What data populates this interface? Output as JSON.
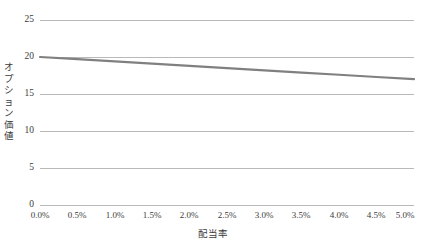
{
  "chart_data": {
    "type": "line",
    "title": "",
    "xlabel": "配当率",
    "ylabel": "オプション価値",
    "xlim": [
      0,
      5
    ],
    "ylim": [
      0,
      25
    ],
    "grid": true,
    "legend": "none",
    "x_tick_labels": [
      "0.0%",
      "0.5%",
      "1.0%",
      "1.5%",
      "2.0%",
      "2.5%",
      "3.0%",
      "3.5%",
      "4.0%",
      "4.5%",
      "5.0%"
    ],
    "y_tick_labels": [
      "0",
      "5",
      "10",
      "15",
      "20",
      "25"
    ],
    "x": [
      0,
      0.5,
      1.0,
      1.5,
      2.0,
      2.5,
      3.0,
      3.5,
      4.0,
      4.5,
      5.0
    ],
    "series": [
      {
        "name": "オプション価値",
        "color": "#808080",
        "values": [
          20.0,
          19.7,
          19.4,
          19.1,
          18.8,
          18.5,
          18.2,
          17.9,
          17.6,
          17.3,
          17.0
        ]
      }
    ]
  },
  "axis": {
    "y_title_chars": [
      "オ",
      "プ",
      "シ",
      "ョ",
      "ン",
      "価",
      "値"
    ]
  }
}
